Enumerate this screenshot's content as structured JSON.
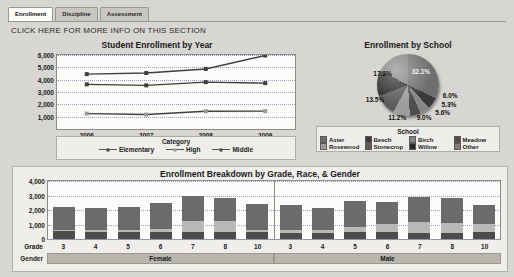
{
  "tabs": [
    {
      "label": "Enrollment",
      "active": true
    },
    {
      "label": "Discipline",
      "active": false
    },
    {
      "label": "Assessment",
      "active": false
    }
  ],
  "info_line": "CLICK HERE FOR MORE INFO ON THIS SECTION",
  "chart_data": [
    {
      "type": "line",
      "title": "Student Enrollment by Year",
      "xlabel": "",
      "ylabel": "",
      "categories": [
        "2006",
        "2007",
        "2008",
        "2009"
      ],
      "ylim": [
        0,
        6000
      ],
      "yticks": [
        1000,
        2000,
        3000,
        4000,
        5000,
        6000
      ],
      "ytick_labels": [
        "1,000",
        "2,000",
        "3,000",
        "4,000",
        "5,000",
        "6,000"
      ],
      "grid": true,
      "legend_title": "Category",
      "legend_position": "bottom",
      "series": [
        {
          "name": "Elementary",
          "values": [
            4450,
            4540,
            4870,
            5960
          ],
          "marker": "square"
        },
        {
          "name": "High",
          "values": [
            1250,
            1170,
            1440,
            1450
          ],
          "marker": "square"
        },
        {
          "name": "Middle",
          "values": [
            3620,
            3540,
            3800,
            3720
          ],
          "marker": "triangle"
        }
      ]
    },
    {
      "type": "pie",
      "title": "Enrollment by School",
      "legend_title": "School",
      "legend_position": "bottom",
      "labels": [
        "Aster",
        "Beech",
        "Birch",
        "Meadow",
        "Rosewood",
        "Stonecrop",
        "Willow",
        "Other"
      ],
      "values": [
        32.1,
        6.0,
        5.3,
        5.6,
        9.0,
        11.2,
        13.5,
        17.3
      ],
      "value_labels": [
        "32.1%",
        "6.0%",
        "5.3%",
        "5.6%",
        "9.0%",
        "11.2%",
        "13.5%",
        "17.3%"
      ],
      "colors": [
        "#6f6f6f",
        "#3a3a3a",
        "#868686",
        "#4e4e4e",
        "#9c9c9c",
        "#5c5c5c",
        "#2b2b2b",
        "#7e7e7e"
      ]
    },
    {
      "type": "bar",
      "subtype": "stacked",
      "title": "Enrollment Breakdown by Grade, Race, & Gender",
      "ylim": [
        0,
        4000
      ],
      "yticks": [
        0,
        1000,
        2000,
        3000,
        4000
      ],
      "ytick_labels": [
        "0",
        "1,000",
        "2,000",
        "3,000",
        "4,000"
      ],
      "grid": true,
      "axis_labels": {
        "grade": "Grade",
        "gender": "Gender"
      },
      "grades": [
        "3",
        "4",
        "5",
        "6",
        "7",
        "8",
        "10"
      ],
      "genders": [
        "Female",
        "Male"
      ],
      "stack_colors": [
        "#4d4d4d",
        "#b9b9b9",
        "#6b6b6b",
        "#8f8f8f"
      ],
      "panels": [
        {
          "gender": "Female",
          "bars": [
            {
              "grade": "3",
              "segments": [
                520,
                120,
                1560,
                0
              ],
              "total": 2200
            },
            {
              "grade": "4",
              "segments": [
                470,
                140,
                1560,
                0
              ],
              "total": 2170
            },
            {
              "grade": "5",
              "segments": [
                480,
                140,
                1570,
                0
              ],
              "total": 2190
            },
            {
              "grade": "6",
              "segments": [
                470,
                200,
                1810,
                0
              ],
              "total": 2480
            },
            {
              "grade": "7",
              "segments": [
                490,
                780,
                1670,
                0
              ],
              "total": 2940
            },
            {
              "grade": "8",
              "segments": [
                480,
                740,
                1640,
                0
              ],
              "total": 2860
            },
            {
              "grade": "10",
              "segments": [
                450,
                180,
                1760,
                0
              ],
              "total": 2390
            }
          ]
        },
        {
          "gender": "Male",
          "bars": [
            {
              "grade": "3",
              "segments": [
                420,
                230,
                1700,
                0
              ],
              "total": 2350
            },
            {
              "grade": "4",
              "segments": [
                420,
                230,
                1500,
                0
              ],
              "total": 2150
            },
            {
              "grade": "5",
              "segments": [
                490,
                330,
                1800,
                0
              ],
              "total": 2620
            },
            {
              "grade": "6",
              "segments": [
                480,
                590,
                1510,
                0
              ],
              "total": 2580
            },
            {
              "grade": "7",
              "segments": [
                420,
                730,
                1780,
                0
              ],
              "total": 2930
            },
            {
              "grade": "8",
              "segments": [
                430,
                680,
                1690,
                0
              ],
              "total": 2800
            },
            {
              "grade": "10",
              "segments": [
                450,
                620,
                1270,
                0
              ],
              "total": 2340
            }
          ]
        }
      ]
    }
  ]
}
